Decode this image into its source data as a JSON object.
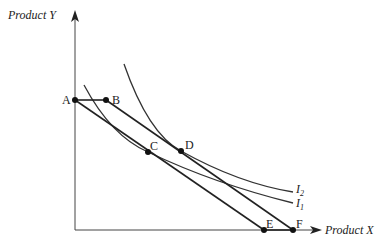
{
  "diagram": {
    "type": "indifference-curve",
    "axes": {
      "x_label": "Product X",
      "y_label": "Product Y"
    },
    "points": [
      {
        "id": "A",
        "label": "A"
      },
      {
        "id": "B",
        "label": "B"
      },
      {
        "id": "C",
        "label": "C"
      },
      {
        "id": "D",
        "label": "D"
      },
      {
        "id": "E",
        "label": "E"
      },
      {
        "id": "F",
        "label": "F"
      }
    ],
    "curves": [
      {
        "id": "I1",
        "label_main": "I",
        "label_sub": "1"
      },
      {
        "id": "I2",
        "label_main": "I",
        "label_sub": "2"
      }
    ],
    "budget_lines": [
      {
        "from": "A",
        "to": "E"
      },
      {
        "from": "B",
        "to": "F"
      }
    ],
    "segments": [
      {
        "from": "A",
        "to": "B"
      },
      {
        "from": "E",
        "to": "F"
      }
    ]
  }
}
